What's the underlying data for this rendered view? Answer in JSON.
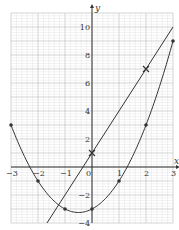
{
  "chart_data": {
    "type": "line",
    "title": "",
    "xlabel": "x",
    "ylabel": "y",
    "xlim": [
      -3,
      3
    ],
    "ylim": [
      -4,
      11
    ],
    "grid": true,
    "x_ticks": [
      "-3",
      "-2",
      "-1",
      "0",
      "1",
      "2",
      "3"
    ],
    "y_ticks": [
      "-4",
      "-2",
      "2",
      "4",
      "6",
      "8",
      "10"
    ],
    "colors": {
      "line": "#333333",
      "grid_minor": "#d6d6d6",
      "grid_major": "#b8b8b8",
      "axis": "#333333"
    },
    "series": [
      {
        "name": "y = 3x + 1",
        "kind": "straight-line",
        "x": [
          -1.6667,
          3
        ],
        "y": [
          -4,
          10
        ],
        "marked_points": {
          "x": [
            0,
            2
          ],
          "y": [
            1,
            7
          ],
          "marker": "cross"
        }
      },
      {
        "name": "y = x^2 + x - 3",
        "kind": "smooth-curve",
        "x": [
          -3,
          -2,
          -1,
          0,
          1,
          2,
          3
        ],
        "y": [
          3,
          -1,
          -3,
          -3,
          -1,
          3,
          9
        ],
        "marker": "dot"
      }
    ]
  }
}
